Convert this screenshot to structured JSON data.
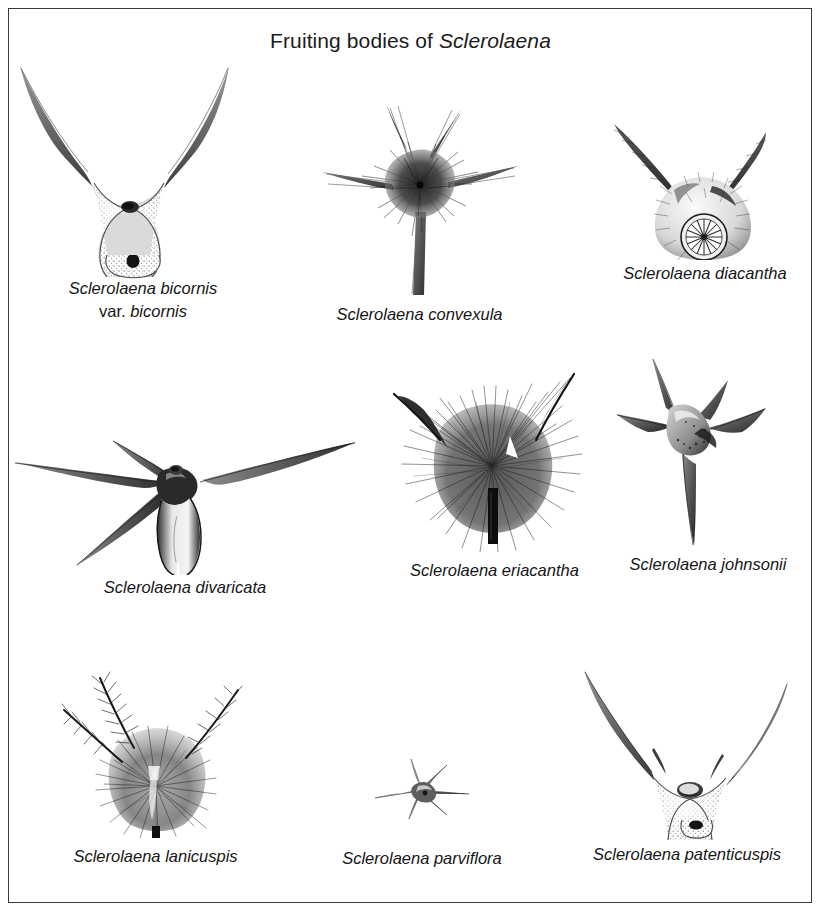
{
  "plate": {
    "title_prefix": "Fruiting bodies of ",
    "title_genus": "Sclerolaena",
    "background_color": "#ffffff",
    "ink_color": "#1b1b1b",
    "border_color": "#3a3a3a"
  },
  "specimens": [
    {
      "id": "bicornis",
      "caption_line1": "Sclerolaena bicornis",
      "caption_rank": "var.",
      "caption_line2_epithet": "bicornis",
      "form": "broad V-shaped body with two long divergent upswept spines, stippled surface, two dark pits"
    },
    {
      "id": "convexula",
      "caption_line1": "Sclerolaena convexula",
      "form": "five-pointed star with dark hairy centre and one long descending spine"
    },
    {
      "id": "diacantha",
      "caption_line1": "Sclerolaena diacantha",
      "form": "rounded hairy body with two upswept spines and a radiating circular disc at base"
    },
    {
      "id": "divaricata",
      "caption_line1": "Sclerolaena divaricata",
      "form": "widely spreading near-horizontal spines with narrow pendant body"
    },
    {
      "id": "eriacantha",
      "caption_line1": "Sclerolaena eriacantha",
      "form": "densely shaggy dark woolly body with two spines and dark central groove"
    },
    {
      "id": "johnsonii",
      "caption_line1": "Sclerolaena johnsonii",
      "form": "sharp four to five rayed star with smooth tapering spines"
    },
    {
      "id": "lanicuspis",
      "caption_line1": "Sclerolaena lanicuspis",
      "form": "woolly body with three hairy ascending spines"
    },
    {
      "id": "parviflora",
      "caption_line1": "Sclerolaena parviflora",
      "form": "small delicate six-pointed star"
    },
    {
      "id": "patenticuspis",
      "caption_line1": "Sclerolaena patenticuspis",
      "form": "narrow V-shaped stippled body with two very long upswept spines"
    }
  ]
}
